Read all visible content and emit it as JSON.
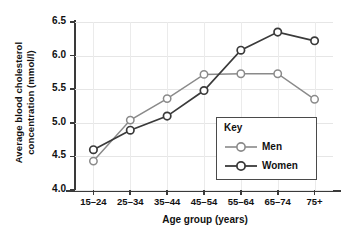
{
  "chart_data": {
    "type": "line",
    "title": "",
    "xlabel": "Age group (years)",
    "ylabel": "Average blood cholesterol concentration (mmol/l)",
    "ylabel_line1": "Average blood cholesterol",
    "ylabel_line2": "concentration (mmol/l)",
    "categories": [
      "15–24",
      "25–34",
      "35–44",
      "45–54",
      "55–64",
      "65–74",
      "75+"
    ],
    "series": [
      {
        "name": "Men",
        "values": [
          4.43,
          5.04,
          5.36,
          5.72,
          5.73,
          5.73,
          5.35
        ],
        "color": "#8a8a8a"
      },
      {
        "name": "Women",
        "values": [
          4.6,
          4.89,
          5.1,
          5.48,
          6.08,
          6.35,
          6.22
        ],
        "color": "#3a3a3a"
      }
    ],
    "ylim": [
      4.0,
      6.5
    ],
    "yticks": [
      "4.0",
      "4.5",
      "5.0",
      "5.5",
      "6.0",
      "6.5"
    ],
    "ytick_values": [
      4.0,
      4.5,
      5.0,
      5.5,
      6.0,
      6.5
    ],
    "grid": true,
    "legend_position": "inside-bottom-right",
    "legend_title": "Key"
  },
  "legend": {
    "title": "Key",
    "entries": [
      {
        "label": "Men",
        "color": "#8a8a8a"
      },
      {
        "label": "Women",
        "color": "#3a3a3a"
      }
    ]
  },
  "axes": {
    "x_title": "Age group (years)",
    "y_title_line1": "Average blood cholesterol",
    "y_title_line2": "concentration (mmol/l)"
  }
}
